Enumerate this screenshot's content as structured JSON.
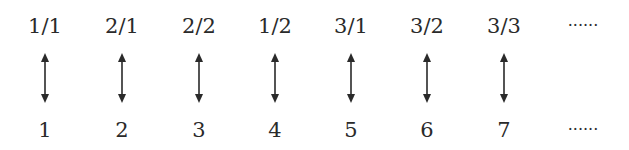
{
  "columns": [
    {
      "top": "1/1",
      "bottom": "1",
      "x": 15,
      "arrow": true
    },
    {
      "top": "2/1",
      "bottom": "2",
      "x": 92,
      "arrow": true
    },
    {
      "top": "2/2",
      "bottom": "3",
      "x": 169,
      "arrow": true
    },
    {
      "top": "1/2",
      "bottom": "4",
      "x": 245,
      "arrow": true
    },
    {
      "top": "3/1",
      "bottom": "5",
      "x": 321,
      "arrow": true
    },
    {
      "top": "3/2",
      "bottom": "6",
      "x": 397,
      "arrow": true
    },
    {
      "top": "3/3",
      "bottom": "7",
      "x": 474,
      "arrow": true
    },
    {
      "top": "······",
      "bottom": "······",
      "x": 553,
      "arrow": false
    }
  ],
  "colors": {
    "ink": "#2a2a2a",
    "background": "#ffffff"
  }
}
